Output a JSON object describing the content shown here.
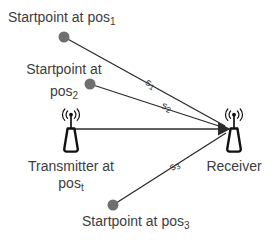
{
  "colors": {
    "background": "#ffffff",
    "text": "#3d3d3d",
    "line": "#2b2b2b",
    "dot": "#6f6f6f",
    "icon": "#111111"
  },
  "nodes": {
    "startpoint1": {
      "label": "Startpoint at pos",
      "sub": "1"
    },
    "startpoint2": {
      "line1": "Startpoint at",
      "line2": "pos",
      "sub": "2"
    },
    "startpoint3": {
      "label": "Startpoint at pos",
      "sub": "3"
    },
    "transmitter": {
      "line1": "Transmitter at",
      "line2": "pos",
      "sub": "t"
    },
    "receiver": {
      "label": "Receiver"
    }
  },
  "paths": {
    "s1": {
      "label": "s",
      "sub": "1"
    },
    "s2": {
      "label": "s",
      "sub": "2"
    },
    "s3": {
      "label": "s",
      "sub": "3"
    }
  }
}
